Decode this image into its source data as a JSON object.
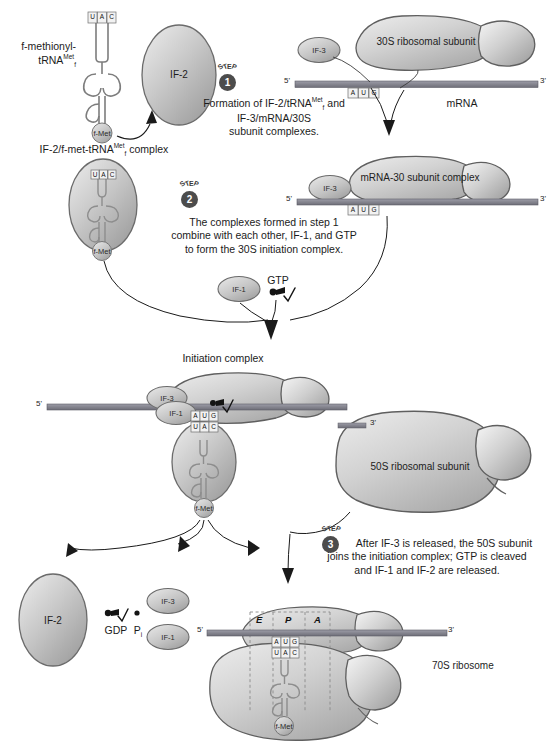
{
  "diagram": {
    "type": "biology-process-diagram"
  },
  "labels": {
    "fmet_trna": "f-methionyl-",
    "fmet_trna_2": "tRNA",
    "fmet_trna_sup": "Met",
    "fmet_trna_sub": "f",
    "if2_complex_a": "IF-2/f-met-tRNA",
    "if2_complex_sup": "Met",
    "if2_complex_sub": "f",
    "if2_complex_b": " complex",
    "mrna": "mRNA",
    "subunit_30s": "30S ribosomal subunit",
    "mrna_30_complex": "mRNA-30 subunit complex",
    "initiation_complex": "Initiation complex",
    "subunit_50s": "50S ribosomal subunit",
    "ribosome_70s": "70S ribosome",
    "gtp": "GTP",
    "gdp": "GDP",
    "pi": "P",
    "pi_sub": "i",
    "fmet": "f-Met",
    "five_prime": "5'",
    "three_prime": "3'"
  },
  "factors": {
    "if1": "IF-1",
    "if2": "IF-2",
    "if3": "IF-3"
  },
  "codons": {
    "mrna_codon": [
      "A",
      "U",
      "G"
    ],
    "anticodon": [
      "U",
      "A",
      "C"
    ]
  },
  "sites": {
    "e": "E",
    "p": "P",
    "a": "A"
  },
  "steps": [
    {
      "word": "STEP",
      "number": "1",
      "text": "Formation of IF-2/tRNA",
      "text_sup": "Met",
      "text_sub": "f",
      "text2": " and",
      "line2": "IF-3/mRNA/30S",
      "line3": "subunit complexes."
    },
    {
      "word": "STEP",
      "number": "2",
      "line1": "The complexes formed in step 1",
      "line2": "combine with each other, IF-1, and GTP",
      "line3": "to form the 30S initiation complex."
    },
    {
      "word": "STEP",
      "number": "3",
      "line1": "After IF-3 is released, the 50S subunit",
      "line2": "joins the initiation complex; GTP is cleaved",
      "line3": "and IF-1 and IF-2 are released."
    }
  ],
  "colors": {
    "blob_light": "#dcdcdc",
    "blob_mid": "#c2c2c2",
    "blob_dark": "#a9a9a9",
    "outline": "#5a5a5a",
    "mrna_bar": "#8b8b95",
    "step_badge": "#4c4c4c",
    "text": "#1b1b1b",
    "fmet_circle": "#c8c8c8"
  }
}
